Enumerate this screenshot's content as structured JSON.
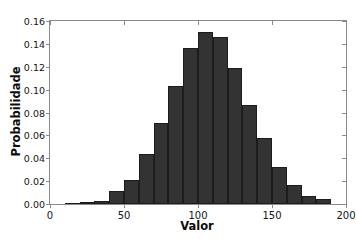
{
  "chart": {
    "type": "bar",
    "title": "",
    "xlabel": "Valor",
    "ylabel": "Probabilidade"
  },
  "chart_data": {
    "type": "bar",
    "title": "",
    "subtitle": "",
    "xlabel": "Valor",
    "ylabel": "Probabilidade",
    "xlim": [
      0,
      200
    ],
    "ylim": [
      0.0,
      0.16
    ],
    "grid": false,
    "legend": null,
    "bin_width": 10,
    "bin_edges": [
      0,
      10,
      20,
      30,
      40,
      50,
      60,
      70,
      80,
      90,
      100,
      110,
      120,
      130,
      140,
      150,
      160,
      170,
      180,
      190,
      200
    ],
    "bin_centers": [
      5,
      15,
      25,
      35,
      45,
      55,
      65,
      75,
      85,
      95,
      105,
      115,
      125,
      135,
      145,
      155,
      165,
      175,
      185,
      195
    ],
    "categories": [
      "0-10",
      "10-20",
      "20-30",
      "30-40",
      "40-50",
      "50-60",
      "60-70",
      "70-80",
      "80-90",
      "90-100",
      "100-110",
      "110-120",
      "120-130",
      "130-140",
      "140-150",
      "150-160",
      "160-170",
      "170-180",
      "180-190",
      "190-200"
    ],
    "values": [
      0.0,
      0.001,
      0.002,
      0.003,
      0.011,
      0.021,
      0.044,
      0.071,
      0.103,
      0.136,
      0.15,
      0.146,
      0.119,
      0.087,
      0.058,
      0.032,
      0.017,
      0.007,
      0.004,
      0.0
    ],
    "xticks": [
      0,
      50,
      100,
      150,
      200
    ],
    "xtick_labels": [
      "0",
      "50",
      "100",
      "150",
      "200"
    ],
    "yticks": [
      0.0,
      0.02,
      0.04,
      0.06,
      0.08,
      0.1,
      0.12,
      0.14,
      0.16
    ],
    "ytick_labels": [
      "0.00",
      "0.02",
      "0.04",
      "0.06",
      "0.08",
      "0.10",
      "0.12",
      "0.14",
      "0.16"
    ],
    "colors": {
      "bar_fill": "#333333",
      "bar_edge": "#1c1c1c",
      "axis": "#8a8a8a",
      "text": "#141414",
      "background": "#ffffff"
    }
  }
}
